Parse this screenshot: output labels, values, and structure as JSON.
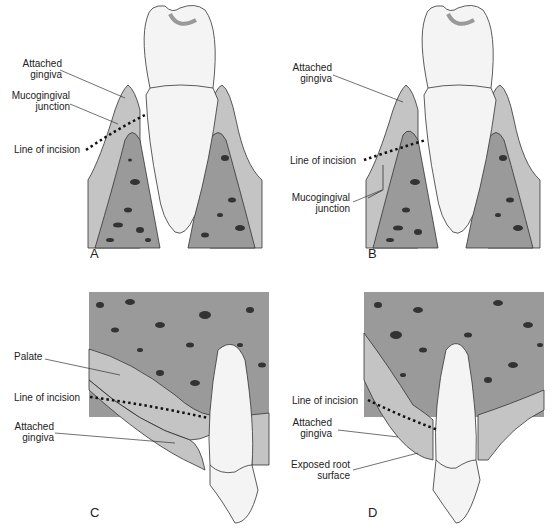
{
  "figure": {
    "panels": [
      {
        "id": "A",
        "letter": "A",
        "labels": {
          "attached_gingiva": "Attached\ngingiva",
          "mucogingival_junction": "Mucogingival\njunction",
          "line_of_incision": "Line of incision"
        }
      },
      {
        "id": "B",
        "letter": "B",
        "labels": {
          "attached_gingiva": "Attached\ngingiva",
          "line_of_incision": "Line of incision",
          "mucogingival_junction": "Mucogingival\njunction"
        }
      },
      {
        "id": "C",
        "letter": "C",
        "labels": {
          "palate": "Palate",
          "line_of_incision": "Line of incision",
          "attached_gingiva": "Attached\ngingiva"
        }
      },
      {
        "id": "D",
        "letter": "D",
        "labels": {
          "line_of_incision": "Line of incision",
          "attached_gingiva": "Attached\ngingiva",
          "exposed_root_surface": "Exposed root\nsurface"
        }
      }
    ],
    "colors": {
      "bone": "#9a9a9a",
      "gingiva": "#c4c4c4",
      "tooth": "#f4f4f4",
      "root": "#e6e6e6",
      "outline": "#333333",
      "incision_dots": "#111111"
    }
  }
}
